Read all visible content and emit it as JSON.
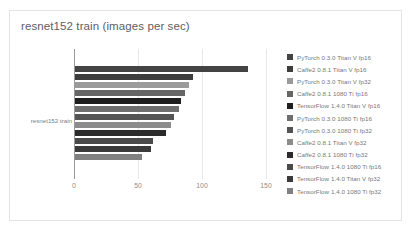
{
  "chart_data": {
    "type": "bar",
    "orientation": "horizontal",
    "title": "resnet152 train (images per sec)",
    "xlabel": "",
    "ylabel": "",
    "categories": [
      "resnet152 train"
    ],
    "category_label": "resnet152 train",
    "xlim": [
      0,
      150
    ],
    "xticks": [
      0,
      50,
      100,
      150
    ],
    "xtick_labels": [
      "0",
      "50",
      "100",
      "150"
    ],
    "grid": true,
    "legend_position": "right",
    "series": [
      {
        "name": "PyTorch 0.3.0 Titan V fp16",
        "value": 135,
        "color": "#434343"
      },
      {
        "name": "Caffe2 0.8.1 Titan V fp16",
        "value": 92,
        "color": "#3d3d3d"
      },
      {
        "name": "PyTorch 0.3.0 Titan V fp32",
        "value": 89,
        "color": "#9a9a9a"
      },
      {
        "name": "Caffe2 0.8.1 1080 Ti fp16",
        "value": 86,
        "color": "#666666"
      },
      {
        "name": "TensorFlow 1.4.0 Titan V fp16",
        "value": 83,
        "color": "#1f1f1f"
      },
      {
        "name": "PyTorch 0.3.0 1080 Ti fp16",
        "value": 81,
        "color": "#6e6e6e"
      },
      {
        "name": "PyTorch 0.3.0 1080 Ti fp32",
        "value": 77,
        "color": "#545454"
      },
      {
        "name": "Caffe2 0.8.1 Titan V fp32",
        "value": 75,
        "color": "#8c8c8c"
      },
      {
        "name": "Caffe2 0.8.1 1080 Ti fp32",
        "value": 71,
        "color": "#2b2b2b"
      },
      {
        "name": "TensorFlow 1.4.0 1080 Ti fp16",
        "value": 61,
        "color": "#4a4a4a"
      },
      {
        "name": "TensorFlow 1.4.0 Titan V fp32",
        "value": 59,
        "color": "#3a3a3a"
      },
      {
        "name": "TensorFlow 1.4.0 1080 Ti fp32",
        "value": 52,
        "color": "#808080"
      }
    ]
  }
}
